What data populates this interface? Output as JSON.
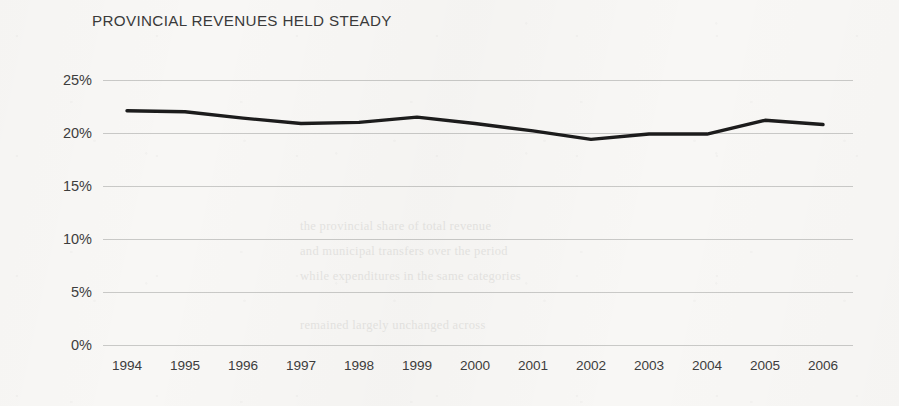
{
  "chart_data": {
    "type": "line",
    "title": "PROVINCIAL REVENUES HELD STEADY",
    "xlabel": "",
    "ylabel": "",
    "categories": [
      "1994",
      "1995",
      "1996",
      "1997",
      "1998",
      "1999",
      "2000",
      "2001",
      "2002",
      "2003",
      "2004",
      "2005",
      "2006"
    ],
    "x": [
      1994,
      1995,
      1996,
      1997,
      1998,
      1999,
      2000,
      2001,
      2002,
      2003,
      2004,
      2005,
      2006
    ],
    "values": [
      22.1,
      22.0,
      21.4,
      20.9,
      21.0,
      21.5,
      20.9,
      20.2,
      19.4,
      19.9,
      19.9,
      21.2,
      20.8
    ],
    "series": [
      {
        "name": "Provincial revenues",
        "values": [
          22.1,
          22.0,
          21.4,
          20.9,
          21.0,
          21.5,
          20.9,
          20.2,
          19.4,
          19.9,
          19.9,
          21.2,
          20.8
        ]
      }
    ],
    "ylim": [
      0,
      25
    ],
    "yticks": [
      0,
      5,
      10,
      15,
      20,
      25
    ],
    "ytick_labels": [
      "0%",
      "5%",
      "10%",
      "15%",
      "20%",
      "25%"
    ],
    "xtick_labels": [
      "1994",
      "1995",
      "1996",
      "1997",
      "1998",
      "1999",
      "2000",
      "2001",
      "2002",
      "2003",
      "2004",
      "2005",
      "2006"
    ],
    "grid": "horizontal",
    "legend": "none",
    "value_unit": "%",
    "colors": {
      "background": "#f8f7f5",
      "line": "#1c1c1c",
      "gridline": "#c9c9c7",
      "text": "#3d3d3d",
      "title": "#3a3a3a"
    },
    "line_width_px": 3.4,
    "annotations": []
  },
  "background_text": {
    "fragments": [
      "the provincial share of total revenue",
      "and municipal transfers over the period",
      "while expenditures in the same categories",
      "remained largely unchanged across"
    ]
  }
}
